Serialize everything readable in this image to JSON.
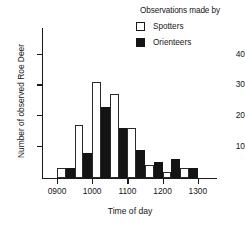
{
  "legend": {
    "title": "Observations made by",
    "entries": [
      {
        "label": "Spotters",
        "swatch": "open-square-icon",
        "color": "#ffffff"
      },
      {
        "label": "Orienteers",
        "swatch": "filled-square-icon",
        "color": "#141414"
      }
    ]
  },
  "axes": {
    "y_title": "Number of observed Roe Deer",
    "x_title": "Time of day",
    "y_ticks": [
      "10",
      "20",
      "30",
      "40"
    ],
    "x_ticks": [
      "0900",
      "1000",
      "1100",
      "1200",
      "1300"
    ]
  },
  "chart_data": {
    "type": "bar",
    "title": "",
    "subtitle": "",
    "xlabel": "Time of day",
    "ylabel": "Number of observed Roe Deer",
    "categories": [
      "0900",
      "0930",
      "1000",
      "1030",
      "1100",
      "1130",
      "1200",
      "1230"
    ],
    "bin_width_minutes": 30,
    "x_range": [
      "0900",
      "1300"
    ],
    "ylim": [
      0,
      45
    ],
    "yticks": [
      10,
      20,
      30,
      40
    ],
    "grid": false,
    "legend_position": "top-right",
    "legend_title": "Observations made by",
    "series": [
      {
        "name": "Spotters",
        "color": "#ffffff",
        "edge_color": "#2a2a2a",
        "values": [
          3,
          17,
          31,
          27,
          16,
          4,
          2,
          3
        ]
      },
      {
        "name": "Orienteers",
        "color": "#141414",
        "edge_color": "#141414",
        "values": [
          3,
          8,
          23,
          16,
          9,
          5,
          6,
          3
        ]
      }
    ]
  }
}
